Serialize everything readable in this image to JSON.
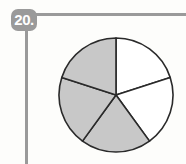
{
  "problem": {
    "number_label": "20."
  },
  "colors": {
    "shaded": "#c8c8c8",
    "unshaded": "#ffffff",
    "stroke": "#2a2a2a",
    "frame": "#9a9a9a"
  },
  "chart_data": {
    "type": "pie",
    "title": "",
    "categories": [
      "slice 1",
      "slice 2",
      "slice 3",
      "slice 4",
      "slice 5"
    ],
    "values": [
      1,
      1,
      1,
      1,
      1
    ],
    "shaded": [
      false,
      false,
      true,
      true,
      true
    ],
    "total_parts": 5,
    "shaded_parts": 3,
    "fraction_shaded": "3/5"
  }
}
